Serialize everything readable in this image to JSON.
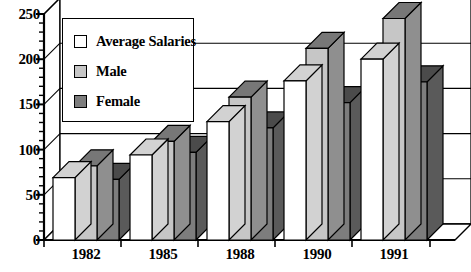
{
  "chart_data": {
    "type": "bar",
    "title": "",
    "subtitle": "",
    "xlabel": "",
    "ylabel": "",
    "categories": [
      "1982",
      "1985",
      "1988",
      "1990",
      "1991"
    ],
    "series": [
      {
        "name": "Average Salaries",
        "color": "#ffffff",
        "values": [
          69,
          94,
          131,
          176,
          200
        ]
      },
      {
        "name": "Male",
        "color": "#c6c6c6",
        "values": [
          82,
          109,
          158,
          212,
          245
        ]
      },
      {
        "name": "Female",
        "color": "#7d7d7d",
        "values": [
          67,
          97,
          124,
          152,
          175
        ]
      }
    ],
    "ylim": [
      0,
      250
    ],
    "yticks": [
      0,
      50,
      100,
      150,
      200,
      250
    ],
    "ytick_labels": [
      "0",
      "50",
      "100",
      "150",
      "200",
      "250"
    ],
    "minor_tick_step": 10,
    "grid": true,
    "legend_position": "top-left",
    "style": "3d-bar",
    "annotations": []
  },
  "legend": {
    "entries": [
      {
        "label": "Average Salaries",
        "swatch": "avg"
      },
      {
        "label": "Male",
        "swatch": "male"
      },
      {
        "label": "Female",
        "swatch": "female"
      }
    ]
  }
}
